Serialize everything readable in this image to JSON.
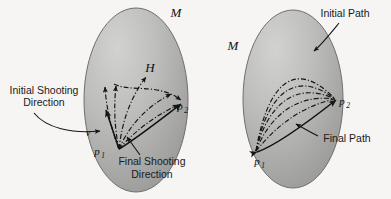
{
  "figure": {
    "background_color": "#f6f5f3",
    "width": 391,
    "height": 199
  },
  "left_panel": {
    "name": "shooting-method-diagram",
    "manifold_label": "M",
    "variation_field_label": "H",
    "start_point_label": "p",
    "start_point_sub": "1",
    "end_point_label": "p",
    "end_point_sub": "2",
    "velocity_label": "v",
    "annotations": [
      {
        "id": "initial-shooting",
        "line1": "Initial Shooting",
        "line2": "Direction"
      },
      {
        "id": "final-shooting",
        "line1": "Final Shooting",
        "line2": "Direction"
      }
    ],
    "ellipse": {
      "cx": 136,
      "cy": 100,
      "rx": 52,
      "ry": 92,
      "fill_light": "#c9c9c7",
      "fill_dark": "#9a9a98",
      "stroke": "#6f6f6f"
    }
  },
  "right_panel": {
    "name": "path-convergence-diagram",
    "manifold_label": "M",
    "start_point_label": "p",
    "start_point_sub": "1",
    "end_point_label": "p",
    "end_point_sub": "2",
    "annotations": [
      {
        "id": "initial-path",
        "line1": "Initial Path"
      },
      {
        "id": "final-path",
        "line1": "Final Path"
      }
    ],
    "ellipse": {
      "cx": 293,
      "cy": 99,
      "rx": 50,
      "ry": 89,
      "fill_light": "#c9c9c7",
      "fill_dark": "#9a9a98",
      "stroke": "#6f6f6f"
    }
  },
  "colors": {
    "ink": "#151515",
    "page": "#f6f5f3",
    "surface_light": "#c9c9c7",
    "surface_dark": "#9a9a98"
  }
}
